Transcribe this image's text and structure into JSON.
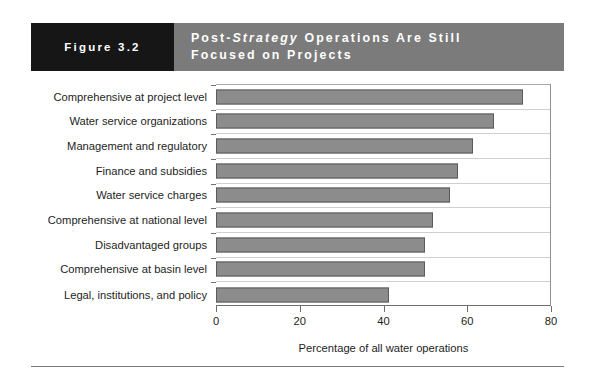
{
  "header": {
    "figure_number": "Figure 3.2",
    "title_line_1_prefix": "Post-",
    "title_line_1_italic": "Strategy",
    "title_line_1_suffix": " Operations Are Still",
    "title_line_2": "Focused on Projects",
    "box_color": "#161616",
    "band_color": "#7b7b7b",
    "text_color": "#ffffff"
  },
  "chart_data": {
    "type": "bar",
    "orientation": "horizontal",
    "title": "Post-Strategy Operations Are Still Focused on Projects",
    "categories": [
      "Comprehensive at project level",
      "Water service organizations",
      "Management and regulatory",
      "Finance and subsidies",
      "Water service charges",
      "Comprehensive at national level",
      "Disadvantaged groups",
      "Comprehensive at basin level",
      "Legal, institutions, and policy"
    ],
    "values": [
      73.5,
      66.5,
      61.5,
      58,
      56,
      52,
      50,
      50,
      41.5
    ],
    "xlabel": "Percentage of all water operations",
    "ylabel": "",
    "xlim": [
      0,
      80
    ],
    "xticks": [
      0,
      20,
      40,
      60,
      80
    ],
    "xtick_labels": [
      "0",
      "20",
      "40",
      "60",
      "80"
    ],
    "grid": false,
    "legend": false,
    "bar_color": "#8c8c8c",
    "bar_border_color": "#5b5b5b"
  }
}
